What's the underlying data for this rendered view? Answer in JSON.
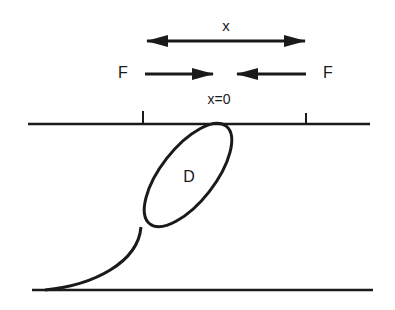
{
  "diagram": {
    "labels": {
      "displacement": "x",
      "force_left": "F",
      "force_right": "F",
      "origin": "x=0",
      "dislocation": "D"
    },
    "colors": {
      "stroke": "#1a1a1a",
      "background": "#ffffff"
    },
    "elements": [
      "double-headed displacement arrow labeled x",
      "two opposing force arrows labeled F pointing toward x=0",
      "upper horizontal line with two tick marks",
      "tilted ellipse labeled D touching upper line",
      "curved tail from ellipse to lower horizontal line",
      "lower horizontal line"
    ]
  }
}
